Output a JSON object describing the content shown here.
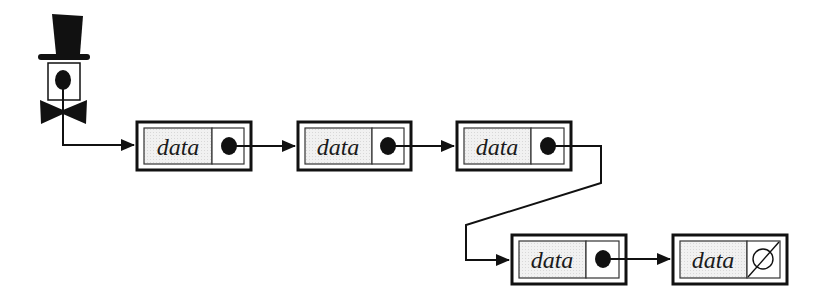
{
  "diagram": {
    "type": "singly-linked-list",
    "head_pointer": {
      "icon": "top-hat-gentleman-icon"
    },
    "nodes": [
      {
        "label": "data",
        "next": "pointer"
      },
      {
        "label": "data",
        "next": "pointer"
      },
      {
        "label": "data",
        "next": "pointer"
      },
      {
        "label": "data",
        "next": "pointer"
      },
      {
        "label": "data",
        "next": "null",
        "null_symbol": "∅"
      }
    ],
    "colors": {
      "stroke": "#111111",
      "data_fill": "#efefef",
      "background": "#ffffff"
    }
  }
}
